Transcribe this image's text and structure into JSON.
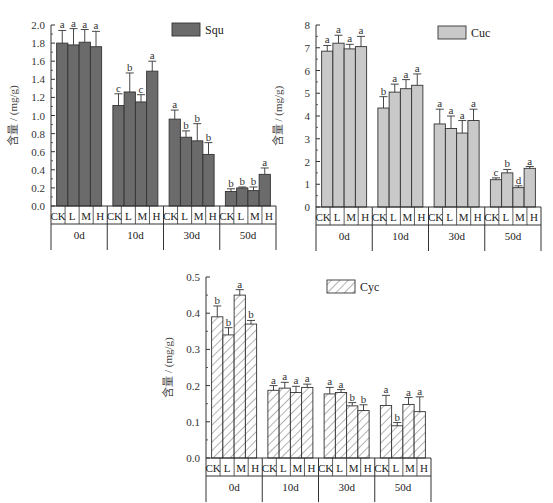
{
  "chart_data": [
    {
      "type": "bar",
      "title": "",
      "legend": "Squ",
      "fill": "#6b6b6b",
      "pattern": "solid",
      "ylabel": "含量 / (mg/g)",
      "xlabel": "",
      "ylim": [
        0,
        2.0
      ],
      "yticks": [
        "0.0",
        "0.2",
        "0.4",
        "0.6",
        "0.8",
        "1.0",
        "1.2",
        "1.4",
        "1.6",
        "1.8",
        "2.0"
      ],
      "groups": [
        "0d",
        "10d",
        "30d",
        "50d"
      ],
      "treatments": [
        "CK",
        "L",
        "M",
        "H"
      ],
      "values": [
        [
          1.8,
          1.78,
          1.81,
          1.76
        ],
        [
          1.11,
          1.26,
          1.15,
          1.49
        ],
        [
          0.96,
          0.76,
          0.72,
          0.57
        ],
        [
          0.16,
          0.2,
          0.17,
          0.35
        ]
      ],
      "error_top": [
        [
          1.94,
          1.96,
          1.95,
          1.93
        ],
        [
          1.24,
          1.47,
          1.23,
          1.6
        ],
        [
          1.06,
          0.83,
          0.91,
          0.7
        ],
        [
          0.19,
          0.21,
          0.21,
          0.42
        ]
      ],
      "significance": [
        [
          "a",
          "a",
          "a",
          "a"
        ],
        [
          "c",
          "b",
          "c",
          "a"
        ],
        [
          "a",
          "b",
          "b",
          "b"
        ],
        [
          "b",
          "b",
          "b",
          "a"
        ]
      ]
    },
    {
      "type": "bar",
      "title": "",
      "legend": "Cuc",
      "fill": "#c9c9c9",
      "pattern": "solid",
      "ylabel": "含量 / (mg/g)",
      "xlabel": "",
      "ylim": [
        0,
        8
      ],
      "yticks": [
        "0",
        "1",
        "2",
        "3",
        "4",
        "5",
        "6",
        "7",
        "8"
      ],
      "groups": [
        "0d",
        "10d",
        "30d",
        "50d"
      ],
      "treatments": [
        "CK",
        "L",
        "M",
        "H"
      ],
      "values": [
        [
          6.85,
          7.2,
          6.95,
          7.05
        ],
        [
          4.35,
          5.05,
          5.2,
          5.35
        ],
        [
          3.65,
          3.45,
          3.25,
          3.8
        ],
        [
          1.2,
          1.5,
          0.85,
          1.7
        ]
      ],
      "error_top": [
        [
          7.1,
          7.55,
          7.15,
          7.5
        ],
        [
          4.85,
          5.4,
          5.6,
          5.85
        ],
        [
          4.3,
          4.0,
          3.8,
          4.3
        ],
        [
          1.28,
          1.65,
          0.93,
          1.78
        ]
      ],
      "significance": [
        [
          "a",
          "a",
          "a",
          "a"
        ],
        [
          "b",
          "a",
          "a",
          "a"
        ],
        [
          "a",
          "a",
          "a",
          "a"
        ],
        [
          "c",
          "b",
          "d",
          "a"
        ]
      ]
    },
    {
      "type": "bar",
      "title": "",
      "legend": "Cyc",
      "fill": "#ffffff",
      "pattern": "hatch",
      "ylabel": "含量 / (mg/g)",
      "xlabel": "",
      "ylim": [
        0,
        0.5
      ],
      "yticks": [
        "0.0",
        "0.1",
        "0.2",
        "0.3",
        "0.4",
        "0.5"
      ],
      "groups": [
        "0d",
        "10d",
        "30d",
        "50d"
      ],
      "treatments": [
        "CK",
        "L",
        "M",
        "H"
      ],
      "values": [
        [
          0.39,
          0.34,
          0.45,
          0.37
        ],
        [
          0.187,
          0.193,
          0.181,
          0.195
        ],
        [
          0.177,
          0.181,
          0.144,
          0.131
        ],
        [
          0.145,
          0.089,
          0.148,
          0.128
        ]
      ],
      "error_top": [
        [
          0.42,
          0.36,
          0.465,
          0.38
        ],
        [
          0.2,
          0.209,
          0.198,
          0.204
        ],
        [
          0.195,
          0.189,
          0.153,
          0.147
        ],
        [
          0.173,
          0.098,
          0.167,
          0.169
        ]
      ],
      "significance": [
        [
          "b",
          "b",
          "a",
          "b"
        ],
        [
          "a",
          "a",
          "a",
          "a"
        ],
        [
          "a",
          "a",
          "b",
          "b"
        ],
        [
          "a",
          "b",
          "a",
          "a"
        ]
      ]
    }
  ],
  "layout": [
    {
      "left": 51,
      "right": 276,
      "top": 25,
      "bottom": 206,
      "legend_x": 172,
      "legend_y": 23
    },
    {
      "left": 316,
      "right": 541,
      "top": 25,
      "bottom": 207,
      "legend_x": 438,
      "legend_y": 26
    },
    {
      "left": 206,
      "right": 431,
      "top": 277,
      "bottom": 458,
      "legend_x": 327,
      "legend_y": 280
    }
  ]
}
